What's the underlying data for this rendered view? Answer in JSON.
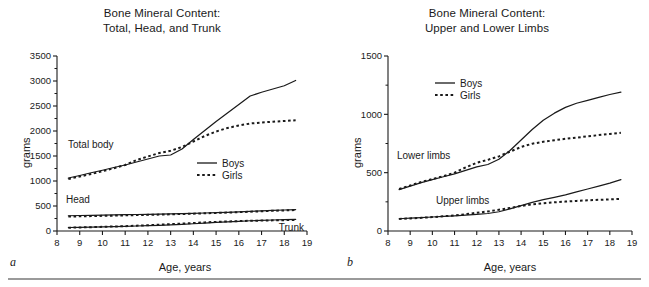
{
  "figure": {
    "bottom_rule": true,
    "background": "#ffffff",
    "line_color": "#1a1a1a"
  },
  "panels": [
    {
      "letter": "a",
      "title_line1": "Bone Mineral Content:",
      "title_line2": "Total, Head, and Trunk",
      "xlabel": "Age, years",
      "ylabel": "grams",
      "legend": {
        "boys": "Boys",
        "girls": "Girls"
      },
      "series_labels": {
        "total": "Total body",
        "head": "Head",
        "trunk": "Trunk"
      }
    },
    {
      "letter": "b",
      "title_line1": "Bone Mineral Content:",
      "title_line2": "Upper and Lower Limbs",
      "xlabel": "Age, years",
      "ylabel": "grams",
      "legend": {
        "boys": "Boys",
        "girls": "Girls"
      },
      "series_labels": {
        "lower": "Lower limbs",
        "upper": "Upper limbs"
      }
    }
  ],
  "chart_data": [
    {
      "type": "line",
      "panel": "a",
      "title": "Bone Mineral Content: Total, Head, and Trunk",
      "xlabel": "Age, years",
      "ylabel": "grams",
      "xlim": [
        8,
        19
      ],
      "ylim": [
        0,
        3500
      ],
      "xticks": [
        8,
        9,
        10,
        11,
        12,
        13,
        14,
        15,
        16,
        17,
        18,
        19
      ],
      "yticks": [
        0,
        500,
        1000,
        1500,
        2000,
        2500,
        3000,
        3500
      ],
      "y_minor_ticks": 250,
      "grid": false,
      "legend_position": "center-right",
      "legend": [
        "Boys",
        "Girls"
      ],
      "x": [
        8.5,
        9,
        9.5,
        10,
        10.5,
        11,
        11.5,
        12,
        12.5,
        13,
        13.5,
        14,
        14.5,
        15,
        15.5,
        16,
        16.5,
        17,
        17.5,
        18,
        18.5
      ],
      "series": [
        {
          "name": "Total body - Boys",
          "group": "Total body",
          "style": "solid",
          "values": [
            1060,
            1110,
            1165,
            1215,
            1270,
            1320,
            1380,
            1440,
            1500,
            1520,
            1640,
            1830,
            2010,
            2190,
            2360,
            2530,
            2700,
            2775,
            2840,
            2905,
            3010
          ]
        },
        {
          "name": "Total body - Girls",
          "group": "Total body",
          "style": "dotted",
          "values": [
            1040,
            1090,
            1140,
            1195,
            1255,
            1320,
            1420,
            1490,
            1560,
            1605,
            1680,
            1790,
            1900,
            1990,
            2060,
            2110,
            2150,
            2170,
            2185,
            2200,
            2215
          ]
        },
        {
          "name": "Head - Boys",
          "group": "Head",
          "style": "solid",
          "values": [
            305,
            310,
            314,
            318,
            322,
            326,
            330,
            334,
            338,
            343,
            348,
            354,
            360,
            366,
            374,
            382,
            392,
            402,
            412,
            420,
            428
          ]
        },
        {
          "name": "Head - Girls",
          "group": "Head",
          "style": "dotted",
          "values": [
            288,
            293,
            298,
            303,
            308,
            313,
            318,
            323,
            328,
            334,
            340,
            347,
            354,
            361,
            369,
            377,
            386,
            395,
            404,
            412,
            420
          ]
        },
        {
          "name": "Trunk - Boys",
          "group": "Trunk",
          "style": "solid",
          "values": [
            70,
            74,
            79,
            84,
            89,
            94,
            100,
            107,
            114,
            123,
            133,
            145,
            158,
            171,
            183,
            194,
            205,
            213,
            220,
            226,
            232
          ]
        },
        {
          "name": "Trunk - Girls",
          "group": "Trunk",
          "style": "dotted",
          "values": [
            66,
            71,
            77,
            83,
            90,
            97,
            106,
            116,
            126,
            137,
            148,
            160,
            172,
            182,
            191,
            198,
            204,
            209,
            213,
            217,
            220
          ]
        }
      ]
    },
    {
      "type": "line",
      "panel": "b",
      "title": "Bone Mineral Content: Upper and Lower Limbs",
      "xlabel": "Age, years",
      "ylabel": "grams",
      "xlim": [
        8,
        19
      ],
      "ylim": [
        0,
        1500
      ],
      "xticks": [
        8,
        9,
        10,
        11,
        12,
        13,
        14,
        15,
        16,
        17,
        18,
        19
      ],
      "yticks": [
        0,
        500,
        1000,
        1500
      ],
      "y_minor_ticks": 250,
      "grid": false,
      "legend_position": "upper-center",
      "legend": [
        "Boys",
        "Girls"
      ],
      "x": [
        8.5,
        9,
        9.5,
        10,
        10.5,
        11,
        11.5,
        12,
        12.5,
        13,
        13.5,
        14,
        14.5,
        15,
        15.5,
        16,
        16.5,
        17,
        17.5,
        18,
        18.5
      ],
      "series": [
        {
          "name": "Lower limbs - Boys",
          "group": "Lower limbs",
          "style": "solid",
          "values": [
            355,
            385,
            415,
            440,
            465,
            490,
            520,
            550,
            570,
            615,
            690,
            780,
            870,
            950,
            1010,
            1060,
            1095,
            1120,
            1145,
            1170,
            1190
          ]
        },
        {
          "name": "Lower limbs - Girls",
          "group": "Lower limbs",
          "style": "dotted",
          "values": [
            360,
            390,
            420,
            445,
            470,
            500,
            545,
            585,
            610,
            640,
            680,
            720,
            748,
            765,
            778,
            790,
            800,
            812,
            822,
            832,
            842
          ]
        },
        {
          "name": "Upper limbs - Boys",
          "group": "Upper limbs",
          "style": "solid",
          "values": [
            105,
            110,
            115,
            120,
            125,
            130,
            136,
            143,
            150,
            165,
            190,
            218,
            245,
            268,
            288,
            310,
            335,
            360,
            385,
            410,
            440
          ]
        },
        {
          "name": "Upper limbs - Girls",
          "group": "Upper limbs",
          "style": "dotted",
          "values": [
            103,
            108,
            113,
            119,
            126,
            134,
            144,
            156,
            168,
            182,
            198,
            215,
            228,
            238,
            246,
            252,
            258,
            263,
            267,
            271,
            275
          ]
        }
      ]
    }
  ]
}
